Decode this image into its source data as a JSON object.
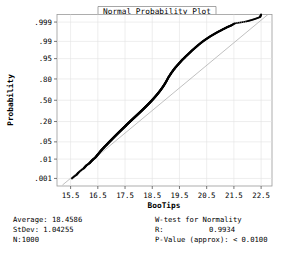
{
  "chart_data": {
    "type": "scatter",
    "title": "Normal Probability Plot",
    "xlabel": "BooTips",
    "ylabel": "Probability",
    "grid": true,
    "legend": "none",
    "xlim": [
      15.0,
      22.9
    ],
    "xticks": [
      "15.5",
      "16.5",
      "17.5",
      "18.5",
      "19.5",
      "20.5",
      "21.5",
      "22.5"
    ],
    "xtick_values": [
      15.5,
      16.5,
      17.5,
      18.5,
      19.5,
      20.5,
      21.5,
      22.5
    ],
    "yticks": [
      ".999",
      ".99",
      ".95",
      ".80",
      ".50",
      ".20",
      ".05",
      ".01",
      ".001"
    ],
    "ytick_values": [
      0.999,
      0.99,
      0.95,
      0.8,
      0.5,
      0.2,
      0.05,
      0.01,
      0.001
    ],
    "yscale": "normal-probability",
    "reference_line": {
      "label": "normal fit line",
      "x1": 15.2,
      "y1": 0.0004,
      "x2": 22.75,
      "y2": 0.99965,
      "color": "#b0b0b0"
    },
    "point_color": "#000000",
    "point_size": 1.7,
    "series": [
      {
        "name": "BooTips ordered data",
        "n": 1000,
        "x": [
          15.55,
          15.72,
          15.8,
          15.98,
          16.03,
          16.08,
          16.18,
          16.22,
          16.26,
          16.3,
          16.34,
          16.4,
          16.44,
          16.47,
          16.5,
          16.54,
          16.57,
          16.6,
          16.63,
          16.66,
          16.7,
          16.73,
          16.76,
          16.8,
          16.83,
          16.86,
          16.89,
          16.92,
          16.95,
          16.98,
          17.01,
          17.04,
          17.07,
          17.1,
          17.13,
          17.16,
          17.19,
          17.22,
          17.25,
          17.28,
          17.31,
          17.34,
          17.37,
          17.4,
          17.43,
          17.46,
          17.49,
          17.52,
          17.54,
          17.57,
          17.6,
          17.63,
          17.66,
          17.69,
          17.72,
          17.75,
          17.78,
          17.81,
          17.84,
          17.87,
          17.9,
          17.93,
          17.96,
          17.99,
          18.02,
          18.05,
          18.08,
          18.11,
          18.14,
          18.17,
          18.2,
          18.23,
          18.26,
          18.29,
          18.32,
          18.35,
          18.38,
          18.41,
          18.44,
          18.47,
          18.5,
          18.53,
          18.56,
          18.59,
          18.62,
          18.65,
          18.68,
          18.71,
          18.74,
          18.77,
          18.8,
          18.83,
          18.86,
          18.89,
          18.92,
          18.95,
          18.98,
          19.01,
          19.04,
          19.07,
          19.1,
          19.14,
          19.17,
          19.2,
          19.24,
          19.27,
          19.31,
          19.34,
          19.38,
          19.42,
          19.46,
          19.5,
          19.54,
          19.58,
          19.62,
          19.67,
          19.71,
          19.76,
          19.81,
          19.86,
          19.91,
          19.96,
          20.02,
          20.08,
          20.14,
          20.2,
          20.27,
          20.34,
          20.41,
          20.48,
          20.55,
          20.62,
          20.7,
          20.78,
          20.86,
          20.94,
          21.02,
          21.1,
          21.18,
          21.26,
          21.34,
          21.42,
          21.52,
          21.98,
          22.22,
          22.46,
          22.5
        ],
        "p": [
          0.001,
          0.0016,
          0.0022,
          0.0035,
          0.0042,
          0.005,
          0.0062,
          0.007,
          0.008,
          0.009,
          0.01,
          0.0115,
          0.013,
          0.0145,
          0.016,
          0.018,
          0.02,
          0.022,
          0.024,
          0.0262,
          0.029,
          0.0315,
          0.034,
          0.0372,
          0.04,
          0.043,
          0.0462,
          0.0496,
          0.053,
          0.0566,
          0.0604,
          0.0644,
          0.0686,
          0.073,
          0.0776,
          0.0824,
          0.0874,
          0.0926,
          0.098,
          0.1036,
          0.1094,
          0.1154,
          0.1216,
          0.128,
          0.1346,
          0.1414,
          0.1484,
          0.1556,
          0.1616,
          0.1692,
          0.177,
          0.185,
          0.1932,
          0.2016,
          0.2102,
          0.219,
          0.228,
          0.2372,
          0.2466,
          0.2562,
          0.266,
          0.276,
          0.2862,
          0.2966,
          0.3072,
          0.318,
          0.329,
          0.3402,
          0.3516,
          0.3632,
          0.375,
          0.387,
          0.3992,
          0.4116,
          0.4242,
          0.437,
          0.45,
          0.4632,
          0.4766,
          0.4902,
          0.504,
          0.518,
          0.5322,
          0.5466,
          0.5612,
          0.576,
          0.591,
          0.6062,
          0.6216,
          0.6372,
          0.653,
          0.669,
          0.6852,
          0.7016,
          0.7182,
          0.735,
          0.752,
          0.7692,
          0.7866,
          0.8042,
          0.82,
          0.836,
          0.848,
          0.86,
          0.872,
          0.882,
          0.892,
          0.9,
          0.908,
          0.916,
          0.923,
          0.93,
          0.936,
          0.942,
          0.947,
          0.952,
          0.9565,
          0.961,
          0.965,
          0.9688,
          0.9722,
          0.9754,
          0.9784,
          0.9812,
          0.9836,
          0.9858,
          0.9878,
          0.9896,
          0.991,
          0.9922,
          0.9932,
          0.9941,
          0.9949,
          0.9956,
          0.9962,
          0.9967,
          0.9971,
          0.9975,
          0.9978,
          0.9981,
          0.9983,
          0.9985,
          0.9988,
          0.9991,
          0.9993,
          0.9995,
          0.99965
        ]
      }
    ]
  },
  "stats": {
    "left": {
      "average_label": "Average: 18.4586",
      "stdev_label": "StDev: 1.04255",
      "n_label": "N:1000"
    },
    "right": {
      "test_title": "W-test for Normality",
      "r_label": "R:",
      "r_value": "0.9934",
      "p_label": "P-Value (approx): < 0.0100"
    }
  }
}
